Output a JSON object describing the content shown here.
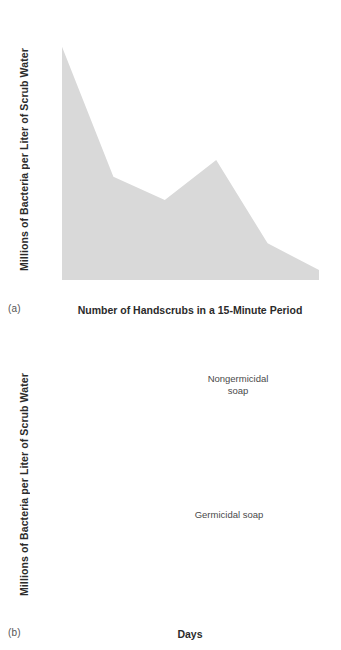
{
  "figure_a": {
    "panel_label": "(a)",
    "ylabel": "Millions of Bacteria per Liter of Scrub Water",
    "xlabel": "Number of Handscrubs in a 15-Minute Period",
    "ytick_labels": [
      "3.5",
      "3.0",
      "2.5",
      "2.0",
      "1.5",
      "1.0",
      ".5"
    ],
    "xtick_labels": [
      "1",
      "2",
      "3",
      "4",
      "5",
      "6"
    ],
    "colors": {
      "area_fill": "#d9d9d9",
      "line": "#231f20",
      "axis": "#8a8a8a"
    }
  },
  "figure_b": {
    "panel_label": "(b)",
    "ylabel": "Millions of Bacteria per Liter of Scrub Water",
    "xlabel": "Days",
    "ytick_labels": [
      "12",
      "10",
      "8",
      "6",
      "4",
      "2"
    ],
    "xtick_labels": [
      "1",
      "2",
      "3",
      "4"
    ],
    "annotation_nongermicidal": "Nongermicidal\nsoap",
    "annotation_germicidal": "Germicidal soap",
    "colors": {
      "line_solid": "#231f20",
      "line_dashed": "#231f20",
      "shadow": "#c9c9c9",
      "halo": "#f0f0f0",
      "axis": "#8a8a8a"
    }
  },
  "chart_data": [
    {
      "type": "area",
      "title": "",
      "xlabel": "Number of Handscrubs in a 15-Minute Period",
      "ylabel": "Millions of Bacteria per Liter of Scrub Water",
      "categories": [
        "1",
        "2",
        "3",
        "4",
        "5",
        "6"
      ],
      "x": [
        1,
        2,
        3,
        4,
        5,
        6
      ],
      "values": [
        3.5,
        1.55,
        1.2,
        1.8,
        0.55,
        0.15
      ],
      "xlim": [
        1,
        6
      ],
      "ylim": [
        0,
        3.75
      ],
      "yticks": [
        0.5,
        1.0,
        1.5,
        2.0,
        2.5,
        3.0,
        3.5
      ],
      "ytick_labels": [
        ".5",
        "1.0",
        "1.5",
        "2.0",
        "2.5",
        "3.0",
        "3.5"
      ],
      "grid": false,
      "legend": "none",
      "panel": "(a)"
    },
    {
      "type": "line",
      "title": "",
      "xlabel": "Days",
      "ylabel": "Millions of Bacteria per Liter of Scrub Water",
      "categories": [
        "1",
        "2",
        "3",
        "4"
      ],
      "x": [
        1,
        2,
        3,
        4
      ],
      "series": [
        {
          "name": "Nongermicidal soap",
          "values": [
            11,
            8,
            12,
            10
          ],
          "style": "dashed"
        },
        {
          "name": "Germicidal soap",
          "values": [
            9,
            4.5,
            2.0,
            1.6
          ],
          "style": "solid"
        }
      ],
      "xlim": [
        1,
        4
      ],
      "ylim": [
        0,
        12.6
      ],
      "yticks": [
        2,
        4,
        6,
        8,
        10,
        12
      ],
      "ytick_labels": [
        "2",
        "4",
        "6",
        "8",
        "10",
        "12"
      ],
      "grid": false,
      "legend": "inline-annotations",
      "panel": "(b)"
    }
  ]
}
